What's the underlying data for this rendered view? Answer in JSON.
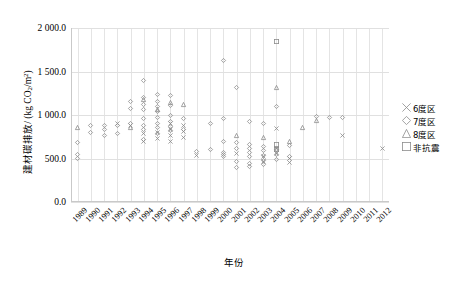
{
  "chart_data": {
    "type": "scatter",
    "title": "",
    "xlabel": "年份",
    "ylabel": "建材碳排放/ (kg CO2/m2)",
    "ylabel_parts": {
      "prefix": "建材碳排放/ (kg CO",
      "sub": "2",
      "mid": "/m",
      "sup": "2",
      "suffix": ")"
    },
    "xlim": [
      1988.5,
      2012.5
    ],
    "ylim": [
      0,
      2000
    ],
    "ytick_labels": [
      "0.0",
      "500.0",
      "1 000.0",
      "1 500.0",
      "2 000.0"
    ],
    "ytick_values": [
      0,
      500,
      1000,
      1500,
      2000
    ],
    "xtick_labels": [
      "1989",
      "1990",
      "1991",
      "1992",
      "1993",
      "1994",
      "1995",
      "1996",
      "1997",
      "1998",
      "1999",
      "2000",
      "2001",
      "2002",
      "2003",
      "2004",
      "2005",
      "2006",
      "2007",
      "2008",
      "2009",
      "2010",
      "2011",
      "2012"
    ],
    "grid": {
      "vertical": true,
      "horizontal": true
    },
    "legend_position": "right",
    "marker_color": "#8c8c8c",
    "grid_color": "#e4e4e4",
    "series": [
      {
        "name": "6度区",
        "marker": "cross",
        "points": [
          [
            1992,
            905
          ],
          [
            1993,
            885
          ],
          [
            1994,
            790
          ],
          [
            1994,
            690
          ],
          [
            1995,
            800
          ],
          [
            1995,
            735
          ],
          [
            1996,
            900
          ],
          [
            1996,
            830
          ],
          [
            1996,
            760
          ],
          [
            1996,
            700
          ],
          [
            1997,
            880
          ],
          [
            1997,
            815
          ],
          [
            1997,
            745
          ],
          [
            1998,
            530
          ],
          [
            2001,
            560
          ],
          [
            2003,
            520
          ],
          [
            2003,
            470
          ],
          [
            2004,
            840
          ],
          [
            2004,
            620
          ],
          [
            2004,
            560
          ],
          [
            2005,
            500
          ],
          [
            2005,
            455
          ],
          [
            2009,
            760
          ],
          [
            2012,
            620
          ]
        ]
      },
      {
        "name": "7度区",
        "marker": "diamond",
        "points": [
          [
            1989,
            680
          ],
          [
            1989,
            545
          ],
          [
            1989,
            495
          ],
          [
            1990,
            875
          ],
          [
            1990,
            800
          ],
          [
            1991,
            880
          ],
          [
            1991,
            835
          ],
          [
            1991,
            760
          ],
          [
            1992,
            885
          ],
          [
            1992,
            790
          ],
          [
            1993,
            905
          ],
          [
            1993,
            1160
          ],
          [
            1993,
            1075
          ],
          [
            1994,
            1395
          ],
          [
            1994,
            1205
          ],
          [
            1994,
            1120
          ],
          [
            1994,
            1060
          ],
          [
            1994,
            955
          ],
          [
            1994,
            885
          ],
          [
            1994,
            835
          ],
          [
            1994,
            720
          ],
          [
            1995,
            1240
          ],
          [
            1995,
            1155
          ],
          [
            1995,
            1100
          ],
          [
            1995,
            1040
          ],
          [
            1995,
            975
          ],
          [
            1995,
            900
          ],
          [
            1995,
            855
          ],
          [
            1995,
            790
          ],
          [
            1996,
            1220
          ],
          [
            1996,
            1115
          ],
          [
            1996,
            1000
          ],
          [
            1996,
            930
          ],
          [
            1996,
            870
          ],
          [
            1996,
            820
          ],
          [
            1997,
            960
          ],
          [
            1997,
            835
          ],
          [
            1998,
            585
          ],
          [
            1999,
            900
          ],
          [
            1999,
            600
          ],
          [
            2000,
            1625
          ],
          [
            2000,
            960
          ],
          [
            2000,
            700
          ],
          [
            2000,
            565
          ],
          [
            2000,
            545
          ],
          [
            2000,
            520
          ],
          [
            2001,
            1320
          ],
          [
            2001,
            680
          ],
          [
            2001,
            620
          ],
          [
            2001,
            470
          ],
          [
            2001,
            395
          ],
          [
            2002,
            930
          ],
          [
            2002,
            665
          ],
          [
            2002,
            620
          ],
          [
            2002,
            570
          ],
          [
            2002,
            520
          ],
          [
            2002,
            440
          ],
          [
            2002,
            410
          ],
          [
            2003,
            905
          ],
          [
            2003,
            640
          ],
          [
            2003,
            590
          ],
          [
            2003,
            540
          ],
          [
            2003,
            480
          ],
          [
            2003,
            430
          ],
          [
            2004,
            1095
          ],
          [
            2004,
            600
          ],
          [
            2004,
            545
          ],
          [
            2004,
            490
          ],
          [
            2005,
            655
          ],
          [
            2005,
            520
          ],
          [
            2007,
            985
          ],
          [
            2008,
            975
          ],
          [
            2009,
            970
          ]
        ]
      },
      {
        "name": "8度区",
        "marker": "triangle",
        "points": [
          [
            1989,
            855
          ],
          [
            1993,
            860
          ],
          [
            1994,
            1180
          ],
          [
            1995,
            1060
          ],
          [
            1996,
            1140
          ],
          [
            1997,
            1125
          ],
          [
            2001,
            760
          ],
          [
            2003,
            740
          ],
          [
            2004,
            1320
          ],
          [
            2005,
            700
          ],
          [
            2006,
            860
          ],
          [
            2007,
            935
          ]
        ]
      },
      {
        "name": "非抗震",
        "marker": "square",
        "points": [
          [
            2004,
            1850
          ],
          [
            2004,
            660
          ],
          [
            2004,
            600
          ]
        ]
      }
    ]
  },
  "legend": {
    "items": [
      {
        "label": "6度区",
        "marker": "cross"
      },
      {
        "label": "7度区",
        "marker": "diamond"
      },
      {
        "label": "8度区",
        "marker": "triangle"
      },
      {
        "label": "非抗震",
        "marker": "square"
      }
    ]
  }
}
